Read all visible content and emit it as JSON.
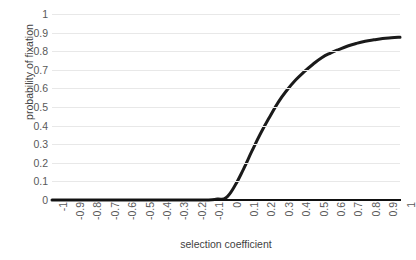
{
  "chart_data": {
    "type": "line",
    "title": "",
    "xlabel": "selection coefficient",
    "ylabel": "probability of fixation",
    "xlim": [
      -1,
      1
    ],
    "ylim": [
      0,
      1
    ],
    "grid": true,
    "legend": null,
    "line_color": "#1a1a1a",
    "grid_color": "#e8e8e8",
    "axis_color": "#111111",
    "xticks": [
      "-1",
      "-0.9",
      "-0.8",
      "-0.7",
      "-0.6",
      "-0.5",
      "-0.4",
      "-0.3",
      "-0.2",
      "-0.1",
      "0",
      "0.1",
      "0.2",
      "0.3",
      "0.4",
      "0.5",
      "0.6",
      "0.7",
      "0.8",
      "0.9",
      "1"
    ],
    "yticks": [
      "1",
      "0.9",
      "0.8",
      "0.7",
      "0.6",
      "0.5",
      "0.4",
      "0.3",
      "0.2",
      "0.1",
      "0"
    ],
    "x": [
      -1,
      -0.9,
      -0.8,
      -0.7,
      -0.6,
      -0.5,
      -0.4,
      -0.3,
      -0.2,
      -0.1,
      -0.05,
      0,
      0.05,
      0.1,
      0.15,
      0.2,
      0.25,
      0.3,
      0.35,
      0.4,
      0.45,
      0.5,
      0.55,
      0.6,
      0.65,
      0.7,
      0.75,
      0.8,
      0.85,
      0.9,
      0.95,
      1
    ],
    "values": [
      0,
      0,
      0,
      0,
      0,
      0,
      0,
      0,
      0,
      0,
      0.005,
      0.012,
      0.075,
      0.165,
      0.265,
      0.36,
      0.445,
      0.525,
      0.59,
      0.645,
      0.69,
      0.73,
      0.765,
      0.79,
      0.81,
      0.828,
      0.842,
      0.853,
      0.861,
      0.868,
      0.872,
      0.875
    ]
  }
}
